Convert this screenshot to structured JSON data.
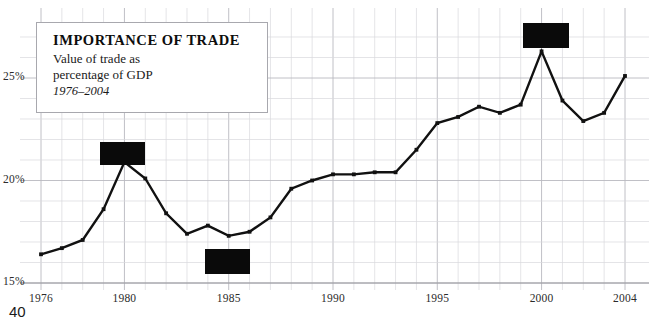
{
  "page": {
    "number": "40",
    "background_color": "#ffffff"
  },
  "callout": {
    "title": "IMPORTANCE OF TRADE",
    "subtitle_line1": "Value of trade as",
    "subtitle_line2": "percentage of GDP",
    "range": "1976–2004"
  },
  "redactions": [
    {
      "name": "redaction-box-1980",
      "x": 100,
      "y": 142,
      "w": 45,
      "h": 23,
      "color": "#0a0a0a"
    },
    {
      "name": "redaction-box-1985",
      "x": 205,
      "y": 249,
      "w": 45,
      "h": 25,
      "color": "#0a0a0a"
    },
    {
      "name": "redaction-box-2000",
      "x": 523,
      "y": 23,
      "w": 46,
      "h": 25,
      "color": "#0a0a0a"
    }
  ],
  "chart_data": {
    "type": "line",
    "title": "IMPORTANCE OF TRADE",
    "subtitle": "Value of trade as percentage of GDP",
    "annotation": "1976–2004",
    "xlabel": "",
    "ylabel": "",
    "x": [
      1976,
      1977,
      1978,
      1979,
      1980,
      1981,
      1982,
      1983,
      1984,
      1985,
      1986,
      1987,
      1988,
      1989,
      1990,
      1991,
      1992,
      1993,
      1994,
      1995,
      1996,
      1997,
      1998,
      1999,
      2000,
      2001,
      2002,
      2003,
      2004
    ],
    "values": [
      16.4,
      16.7,
      17.1,
      18.6,
      20.9,
      20.1,
      18.4,
      17.4,
      17.8,
      17.3,
      17.5,
      18.2,
      19.6,
      20.0,
      20.3,
      20.3,
      20.4,
      20.4,
      21.5,
      22.8,
      23.1,
      23.6,
      23.3,
      23.7,
      26.3,
      23.9,
      22.9,
      23.3,
      25.1
    ],
    "series": [
      {
        "name": "Value of trade as percentage of GDP",
        "values": [
          16.4,
          16.7,
          17.1,
          18.6,
          20.9,
          20.1,
          18.4,
          17.4,
          17.8,
          17.3,
          17.5,
          18.2,
          19.6,
          20.0,
          20.3,
          20.3,
          20.4,
          20.4,
          21.5,
          22.8,
          23.1,
          23.6,
          23.3,
          23.7,
          26.3,
          23.9,
          22.9,
          23.3,
          25.1
        ],
        "color": "#111111"
      }
    ],
    "xlim": [
      1976,
      2004
    ],
    "ylim": [
      15,
      27.1
    ],
    "xticks": [
      1976,
      1980,
      1985,
      1990,
      1995,
      2000,
      2004
    ],
    "xticklabels": [
      "1976",
      "1980",
      "1985",
      "1990",
      "1995",
      "2000",
      "2004"
    ],
    "yticks": [
      15,
      20,
      25
    ],
    "yticklabels": [
      "15%",
      "20%",
      "25%"
    ],
    "grid": true,
    "grid_minor": true,
    "legend": "none",
    "marker": "square",
    "line_color": "#111111"
  }
}
